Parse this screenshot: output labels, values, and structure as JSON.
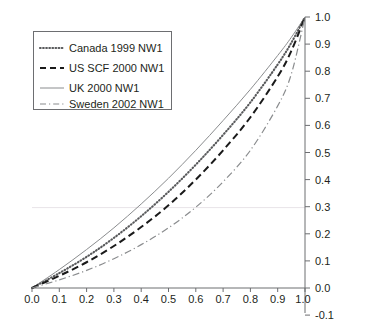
{
  "chart_data": {
    "type": "line",
    "title": "",
    "subtitle": "",
    "xlabel": "",
    "ylabel": "",
    "xlim": [
      0.0,
      1.0
    ],
    "ylim": [
      -0.1,
      1.0
    ],
    "grid": "faint horizontal gridline at y=0.3",
    "legend_position": "upper-left",
    "y_axis_side": "right",
    "x_ticks": [
      "0.0",
      "0.1",
      "0.2",
      "0.3",
      "0.4",
      "0.5",
      "0.6",
      "0.7",
      "0.8",
      "0.9",
      "1.0"
    ],
    "x_tick_values": [
      0.0,
      0.1,
      0.2,
      0.3,
      0.4,
      0.5,
      0.6,
      0.7,
      0.8,
      0.9,
      1.0
    ],
    "y_ticks": [
      "1.0",
      "0.9",
      "0.8",
      "0.7",
      "0.6",
      "0.5",
      "0.4",
      "0.3",
      "0.2",
      "0.1",
      "0.0",
      "-0.1"
    ],
    "y_tick_values": [
      1.0,
      0.9,
      0.8,
      0.7,
      0.6,
      0.5,
      0.4,
      0.3,
      0.2,
      0.1,
      0.0,
      -0.1
    ],
    "x": [
      0.0,
      0.1,
      0.2,
      0.3,
      0.4,
      0.5,
      0.6,
      0.7,
      0.8,
      0.9,
      0.95,
      1.0
    ],
    "series": [
      {
        "name": "Canada 1999 NW1",
        "style": "dotted",
        "color": "#58595b",
        "values": [
          0.0,
          0.055,
          0.115,
          0.185,
          0.265,
          0.355,
          0.455,
          0.565,
          0.685,
          0.825,
          0.905,
          1.0
        ]
      },
      {
        "name": "US SCF 2000 NW1",
        "style": "dashed",
        "color": "#1a1a1a",
        "values": [
          0.0,
          0.045,
          0.095,
          0.155,
          0.225,
          0.305,
          0.4,
          0.508,
          0.63,
          0.78,
          0.875,
          1.0
        ]
      },
      {
        "name": "UK 2000 NW1",
        "style": "solid",
        "color": "#8a8c8e",
        "values": [
          0.0,
          0.068,
          0.142,
          0.222,
          0.31,
          0.405,
          0.508,
          0.618,
          0.733,
          0.858,
          0.925,
          1.0
        ]
      },
      {
        "name": "Sweden 2002 NW1",
        "style": "dash-dot",
        "color": "#8a8c8e",
        "values": [
          0.0,
          0.03,
          0.065,
          0.108,
          0.16,
          0.222,
          0.298,
          0.392,
          0.508,
          0.672,
          0.79,
          1.0
        ]
      }
    ]
  },
  "legend": {
    "items": [
      {
        "label": "Canada 1999 NW1"
      },
      {
        "label": "US SCF 2000 NW1"
      },
      {
        "label": "UK 2000 NW1"
      },
      {
        "label": "Sweden 2002 NW1"
      }
    ]
  }
}
